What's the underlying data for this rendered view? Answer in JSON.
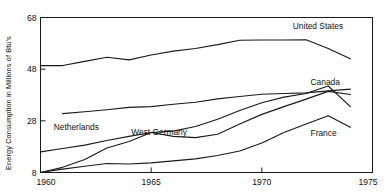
{
  "chart_data": {
    "type": "line",
    "title": "",
    "xlabel": "",
    "ylabel": "Energy Consumption in Millions of Btu's",
    "xlim": [
      1960,
      1975
    ],
    "ylim": [
      8,
      68
    ],
    "xticks": [
      1960,
      1965,
      1970,
      1975
    ],
    "yticks": [
      8,
      28,
      48,
      68
    ],
    "xtick_labels": [
      "1960",
      "1965",
      "1970",
      "1975"
    ],
    "ytick_labels": [
      "8",
      "28",
      "48",
      "68"
    ],
    "grid": false,
    "legend_position": "inline-labels",
    "series": [
      {
        "name": "United States",
        "label": "United States",
        "label_x": 1971.4,
        "label_y": 63.5,
        "x": [
          1960,
          1961,
          1962,
          1963,
          1964,
          1965,
          1966,
          1967,
          1968,
          1969,
          1970,
          1971,
          1972,
          1973,
          1974
        ],
        "values": [
          49.4,
          49.4,
          51.0,
          52.6,
          51.6,
          53.5,
          55.0,
          56.0,
          57.5,
          59.2,
          59.3,
          59.3,
          59.4,
          56.0,
          52.0
        ]
      },
      {
        "name": "Canada",
        "label": "Canada",
        "label_x": 1972.2,
        "label_y": 42.0,
        "x": [
          1961,
          1962,
          1963,
          1964,
          1965,
          1966,
          1967,
          1968,
          1969,
          1970,
          1971,
          1972,
          1973,
          1974
        ],
        "values": [
          30.8,
          31.5,
          32.3,
          33.2,
          33.5,
          34.4,
          35.2,
          36.5,
          37.4,
          38.3,
          38.6,
          38.8,
          39.6,
          40.3
        ]
      },
      {
        "name": "Netherlands",
        "label": "Netherlands",
        "label_x": 1960.6,
        "label_y": 24.6,
        "x": [
          1960,
          1961,
          1962,
          1963,
          1964,
          1965,
          1966,
          1967,
          1968,
          1969,
          1970,
          1971,
          1972,
          1973,
          1974
        ],
        "values": [
          16.0,
          17.3,
          18.6,
          20.4,
          22.0,
          23.5,
          24.0,
          25.8,
          28.6,
          32.0,
          35.0,
          37.2,
          38.6,
          41.5,
          33.5
        ]
      },
      {
        "name": "West Germany",
        "label": "West Germany",
        "label_x": 1964.1,
        "label_y": 22.4,
        "x": [
          1960,
          1961,
          1962,
          1963,
          1964,
          1965,
          1966,
          1967,
          1968,
          1969,
          1970,
          1971,
          1972,
          1973,
          1974
        ],
        "values": [
          8.0,
          10.0,
          13.0,
          17.5,
          20.0,
          23.5,
          22.0,
          21.5,
          22.8,
          26.8,
          30.5,
          33.5,
          36.4,
          39.4,
          38.2
        ]
      },
      {
        "name": "France",
        "label": "France",
        "label_x": 1972.2,
        "label_y": 22.0,
        "x": [
          1960,
          1961,
          1962,
          1963,
          1964,
          1965,
          1966,
          1967,
          1968,
          1969,
          1970,
          1971,
          1972,
          1973,
          1974
        ],
        "values": [
          8.0,
          9.3,
          10.4,
          11.5,
          11.3,
          11.7,
          12.5,
          13.3,
          14.6,
          16.3,
          19.4,
          23.5,
          26.8,
          30.0,
          25.5
        ]
      }
    ],
    "colors": {
      "line": "#1a1a1a",
      "axis": "#1a1a1a",
      "background": "#ffffff",
      "text": "#111111"
    }
  }
}
